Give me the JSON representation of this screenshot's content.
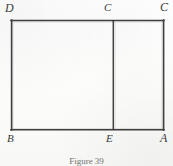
{
  "figure": {
    "caption": "Figure 39",
    "shape_name": "rectangle-with-vertical-divider",
    "stroke_color": "#2b2b2b",
    "background_color": "#fdfdfc",
    "rectangle": {
      "left": 11,
      "top": 20,
      "right": 164,
      "bottom": 130,
      "width": 153,
      "height": 110
    },
    "divider": {
      "orientation": "vertical",
      "x": 113,
      "y_top": 20,
      "y_bottom": 130
    },
    "labels": [
      {
        "text": "D",
        "position": "top-left",
        "x": 5,
        "y": 2
      },
      {
        "text": "C",
        "position": "top-center",
        "x": 104,
        "y": 2
      },
      {
        "text": "C",
        "position": "top-right",
        "x": 160,
        "y": 1
      },
      {
        "text": "B",
        "position": "bottom-left",
        "x": 7,
        "y": 133
      },
      {
        "text": "E",
        "position": "bottom-center",
        "x": 106,
        "y": 133
      },
      {
        "text": "A",
        "position": "bottom-right",
        "x": 160,
        "y": 132
      }
    ]
  }
}
